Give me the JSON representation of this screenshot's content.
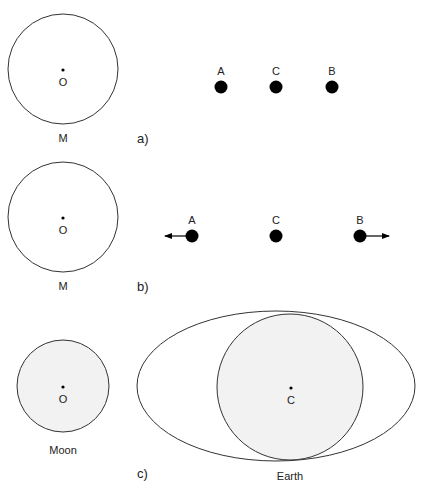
{
  "panels": {
    "a": {
      "tag": "a)",
      "body_label": "M",
      "center_label": "O",
      "points": [
        {
          "label": "A",
          "x": 221
        },
        {
          "label": "C",
          "x": 276
        },
        {
          "label": "B",
          "x": 332
        }
      ]
    },
    "b": {
      "tag": "b)",
      "body_label": "M",
      "center_label": "O",
      "points": [
        {
          "label": "A",
          "x": 192,
          "arrow": "left"
        },
        {
          "label": "C",
          "x": 276,
          "arrow": "none"
        },
        {
          "label": "B",
          "x": 360,
          "arrow": "right"
        }
      ]
    },
    "c": {
      "tag": "c)",
      "moon_label": "Moon",
      "moon_center_label": "O",
      "earth_label": "Earth",
      "earth_center_label": "C"
    }
  },
  "colors": {
    "stroke": "#333333",
    "fill_shaded": "#f2f2f2",
    "dot": "#000000"
  }
}
